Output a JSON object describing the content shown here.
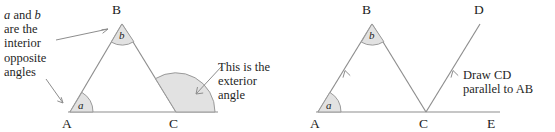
{
  "figure": {
    "colors": {
      "line": "#8d8d8d",
      "sector_fill": "#e2e2e2",
      "sector_stroke": "#9a9a9a",
      "text": "#1c1c1c",
      "background": "#ffffff"
    }
  },
  "left_diagram": {
    "name": "triangle-with-exterior-angle",
    "vertices": {
      "A": "A",
      "B": "B",
      "C": "C"
    },
    "angles": {
      "at_A": "a",
      "at_B": "b"
    },
    "callouts": {
      "interior": "a and b\nare the\ninterior\nopposite\nangles",
      "interior_line1_prefix": "a",
      "interior_line1_mid": " and ",
      "interior_line1_suffix": "b",
      "interior_rest": "are the\ninterior\nopposite\nangles",
      "exterior": "This is the exterior\nangle"
    }
  },
  "right_diagram": {
    "name": "triangle-with-parallel-construction",
    "vertices": {
      "A": "A",
      "B": "B",
      "C": "C",
      "D": "D",
      "E": "E"
    },
    "angles": {
      "at_A": "a",
      "at_B": "b"
    },
    "callouts": {
      "parallel": "Draw CD\nparallel to AB"
    }
  }
}
